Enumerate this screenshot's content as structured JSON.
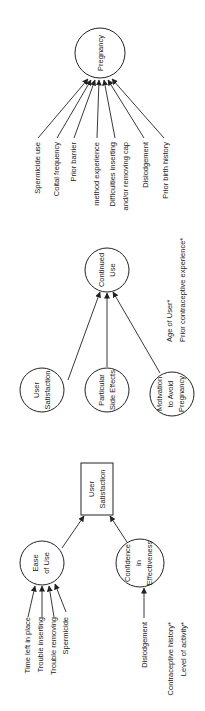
{
  "diagram": {
    "orientation": "rotated-90-ccw",
    "nodes": {
      "pregnancy": {
        "label": "Pregnancy",
        "shape": "circle"
      },
      "continued_use": {
        "line1": "Continued",
        "line2": "Use",
        "shape": "circle"
      },
      "user_satisfaction_circle": {
        "line1": "User",
        "line2": "Satisfaction",
        "shape": "circle"
      },
      "side_effects": {
        "line1": "Particular",
        "line2": "Side Effects",
        "shape": "circle"
      },
      "motivation": {
        "line1": "Motivation",
        "line2": "to Avoid",
        "line3": "Pregnancy",
        "shape": "circle"
      },
      "user_satisfaction_box": {
        "line1": "User",
        "line2": "Satisfaction",
        "shape": "box"
      },
      "ease_of_use": {
        "line1": "Ease",
        "line2": "of Use",
        "shape": "circle"
      },
      "confidence": {
        "line1": "Confidence",
        "line2": "in",
        "line3": "Effectiveness",
        "shape": "circle"
      }
    },
    "pregnancy_inputs": [
      "Spermicide use",
      "Coital frequency",
      "Prior barrier",
      "method experience",
      "Difficulties inserting",
      "and/or removing cap",
      "Dislodgement",
      "Prior birth history"
    ],
    "continued_use_notes": [
      "Age of User*",
      "Prior contraceptive experience*"
    ],
    "ease_of_use_inputs": [
      "Time left in place",
      "Trouble inserting",
      "Trouble removing",
      "Spermicide"
    ],
    "confidence_inputs": [
      "Dislodgement"
    ],
    "confidence_notes": [
      "Contraceptive history*",
      "Level of activity*"
    ],
    "colors": {
      "ink": "#222222",
      "background": "#ffffff"
    }
  }
}
